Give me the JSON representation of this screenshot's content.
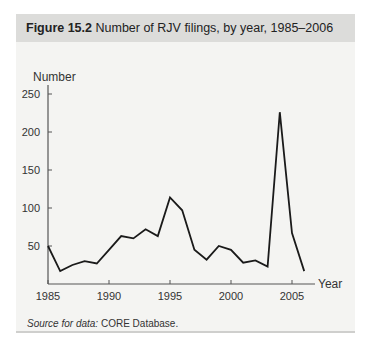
{
  "figure": {
    "label": "Figure 15.2",
    "title": "Number of RJV filings, by year, 1985–2006",
    "source_prefix": "Source for data:",
    "source_text": "CORE Database."
  },
  "colors": {
    "panel_bg": "#f4f4f2",
    "header_bg": "#dcdcda",
    "line": "#1a1a1a",
    "axis": "#555555"
  },
  "chart_data": {
    "type": "line",
    "title": "Number of RJV filings, by year, 1985–2006",
    "xlabel": "Year",
    "ylabel": "Number",
    "x": [
      1985,
      1986,
      1987,
      1988,
      1989,
      1990,
      1991,
      1992,
      1993,
      1994,
      1995,
      1996,
      1997,
      1998,
      1999,
      2000,
      2001,
      2002,
      2003,
      2004,
      2005,
      2006
    ],
    "series": [
      {
        "name": "RJV filings",
        "values": [
          50,
          17,
          25,
          30,
          27,
          45,
          63,
          60,
          72,
          63,
          114,
          97,
          45,
          32,
          50,
          45,
          28,
          31,
          23,
          226,
          67,
          17
        ]
      }
    ],
    "xticks": [
      1985,
      1990,
      1995,
      2000,
      2005
    ],
    "yticks": [
      50,
      100,
      150,
      200,
      250
    ],
    "xlim": [
      1985,
      2007
    ],
    "ylim": [
      0,
      250
    ],
    "grid": false,
    "legend": "none"
  }
}
